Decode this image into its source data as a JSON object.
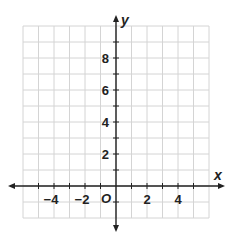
{
  "diagram": {
    "type": "coordinate-plane",
    "x_axis": {
      "label": "x",
      "min": -6,
      "max": 6,
      "tick_labels": [
        "−4",
        "−2",
        "2",
        "4"
      ],
      "tick_values": [
        -4,
        -2,
        2,
        4
      ]
    },
    "y_axis": {
      "label": "y",
      "min": -2,
      "max": 10,
      "tick_labels": [
        "2",
        "4",
        "6",
        "8"
      ],
      "tick_values": [
        2,
        4,
        6,
        8
      ]
    },
    "origin_label": "O",
    "grid_step": 1,
    "colors": {
      "grid": "#d4d4d4",
      "axis": "#222222",
      "text": "#222222"
    }
  },
  "chart_data": {
    "type": "scatter",
    "title": "",
    "xlabel": "x",
    "ylabel": "y",
    "xlim": [
      -6,
      6
    ],
    "ylim": [
      -2,
      10
    ],
    "x_ticks": [
      -4,
      -2,
      2,
      4
    ],
    "y_ticks": [
      2,
      4,
      6,
      8
    ],
    "grid": true,
    "series": []
  }
}
